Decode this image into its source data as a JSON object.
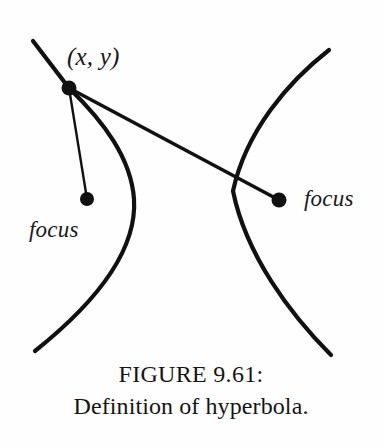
{
  "figure": {
    "domain": "Diagram",
    "background_color": "#fefefe",
    "ink_color": "#111111",
    "width": 382,
    "height": 446,
    "caption": {
      "line1": "FIGURE 9.61:",
      "line2": "Definition of hyperbola."
    },
    "labels": {
      "point_label": "(x, y)",
      "focus_left": "focus",
      "focus_right": "focus"
    },
    "points": [
      {
        "name": "point-xy",
        "x": 69,
        "y": 88,
        "radius": 7.5
      },
      {
        "name": "focus-left",
        "x": 87,
        "y": 199,
        "radius": 7
      },
      {
        "name": "focus-right",
        "x": 279,
        "y": 200,
        "radius": 7.5
      }
    ],
    "curves": {
      "left_branch": {
        "name": "hyperbola-left-branch",
        "stroke_width": 4.2,
        "path": "M 33 41 L 69 88 C 104 122 131 158 134 199 C 137 246 104 296 35 351"
      },
      "right_branch": {
        "name": "hyperbola-right-branch",
        "stroke_width": 4.2,
        "path": "M 329 50 C 288 82 246 131 233 191 C 246 255 290 314 331 355"
      }
    },
    "segments": [
      {
        "name": "segment-point-to-left-focus",
        "x1": 69,
        "y1": 88,
        "x2": 87,
        "y2": 199,
        "stroke_width": 2.4
      },
      {
        "name": "segment-point-to-right-focus",
        "x1": 69,
        "y1": 88,
        "x2": 279,
        "y2": 200,
        "stroke_width": 3.6
      }
    ]
  }
}
